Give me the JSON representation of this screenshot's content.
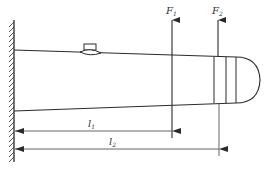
{
  "diagram": {
    "type": "cantilever beam with strain gauge",
    "colors": {
      "line": "#2a2a2a",
      "dim_line": "#555555",
      "background": "#ffffff"
    },
    "forces": [
      {
        "id": "F1",
        "symbol": "F",
        "subscript": "1",
        "x": 172
      },
      {
        "id": "F2",
        "symbol": "F",
        "subscript": "2",
        "x": 218
      }
    ],
    "dimensions": [
      {
        "id": "l1",
        "symbol": "l",
        "subscript": "1",
        "from": "wall",
        "to": "F1"
      },
      {
        "id": "l2",
        "symbol": "l",
        "subscript": "2",
        "from": "wall",
        "to": "F2"
      }
    ],
    "components": {
      "support": "fixed wall (hatched)",
      "sensor": "strain gauge on top surface",
      "end": "banded rounded tip"
    }
  }
}
